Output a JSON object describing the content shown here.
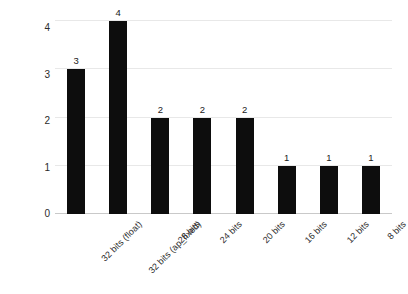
{
  "chart_data": {
    "type": "bar",
    "title": "",
    "xlabel": "",
    "ylabel": "DSPs used",
    "categories": [
      "32 bits (float)",
      "32 bits (ap_fixed)",
      "28 bits",
      "24 bits",
      "20 bits",
      "16 bits",
      "12 bits",
      "8 bits"
    ],
    "values": [
      3,
      4,
      2,
      2,
      2,
      1,
      1,
      1
    ],
    "data_labels": [
      "3",
      "4",
      "2",
      "2",
      "2",
      "1",
      "1",
      "1"
    ],
    "ylim": [
      0,
      4
    ],
    "yticks": [
      "0",
      "1",
      "2",
      "3",
      "4"
    ],
    "grid": true,
    "legend": false,
    "bar_color": "#0d0d0d",
    "gridline_color": "#e8e8e8",
    "axis_color": "#c9c9c9",
    "background_color": "#ffffff"
  }
}
